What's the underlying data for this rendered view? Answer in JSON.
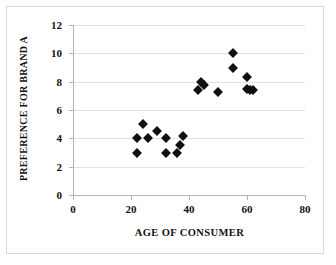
{
  "chart_data": {
    "type": "scatter",
    "title": "",
    "xlabel": "AGE OF CONSUMER",
    "ylabel": "PREFERENCE FOR BRAND A",
    "xlim": [
      0,
      80
    ],
    "ylim": [
      0,
      12
    ],
    "xticks": [
      0,
      20,
      40,
      60,
      80
    ],
    "yticks": [
      0,
      2,
      4,
      6,
      8,
      10,
      12
    ],
    "grid": true,
    "grid_axis": "y",
    "legend": false,
    "marker": "diamond",
    "marker_color": "#101010",
    "points": [
      {
        "x": 22,
        "y": 4.0
      },
      {
        "x": 22,
        "y": 3.0
      },
      {
        "x": 24,
        "y": 5.0
      },
      {
        "x": 26,
        "y": 4.0
      },
      {
        "x": 29,
        "y": 4.5
      },
      {
        "x": 32,
        "y": 4.0
      },
      {
        "x": 32,
        "y": 3.0
      },
      {
        "x": 36,
        "y": 3.0
      },
      {
        "x": 37,
        "y": 3.5
      },
      {
        "x": 38,
        "y": 4.2
      },
      {
        "x": 43,
        "y": 7.4
      },
      {
        "x": 44,
        "y": 8.0
      },
      {
        "x": 45,
        "y": 7.8
      },
      {
        "x": 50,
        "y": 7.3
      },
      {
        "x": 55,
        "y": 10.0
      },
      {
        "x": 55,
        "y": 9.0
      },
      {
        "x": 60,
        "y": 8.3
      },
      {
        "x": 60,
        "y": 7.5
      },
      {
        "x": 61,
        "y": 7.4
      },
      {
        "x": 62,
        "y": 7.4
      }
    ]
  },
  "axes": {
    "x_tick_labels": [
      "0",
      "20",
      "40",
      "60",
      "80"
    ],
    "y_tick_labels": [
      "0",
      "2",
      "4",
      "6",
      "8",
      "10",
      "12"
    ]
  }
}
